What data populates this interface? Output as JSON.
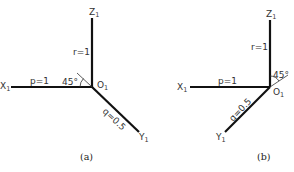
{
  "diagrams": [
    {
      "id": "a",
      "caption": "(a)",
      "origin_label": "O",
      "origin_sub": "1",
      "axes": {
        "x": {
          "label": "X",
          "sub": "1",
          "coef_label": "p=1"
        },
        "y": {
          "label": "Y",
          "sub": "1",
          "coef_label": "q=0.5"
        },
        "z": {
          "label": "Z",
          "sub": "1",
          "coef_label": "r=1"
        }
      },
      "angle_label": "45°"
    },
    {
      "id": "b",
      "caption": "(b)",
      "origin_label": "O",
      "origin_sub": "1",
      "axes": {
        "x": {
          "label": "X",
          "sub": "1",
          "coef_label": "p=1"
        },
        "y": {
          "label": "Y",
          "sub": "1",
          "coef_label": "q=0.5"
        },
        "z": {
          "label": "Z",
          "sub": "1",
          "coef_label": "r=1"
        }
      },
      "angle_label": "45°"
    }
  ]
}
